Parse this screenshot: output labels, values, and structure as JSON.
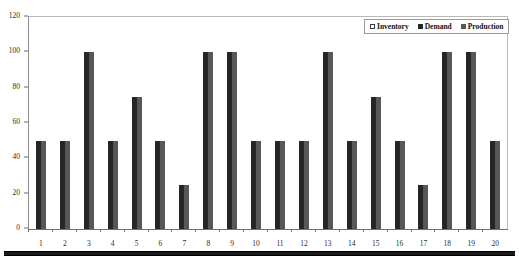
{
  "chart_data": {
    "type": "bar",
    "title": "",
    "xlabel": "",
    "ylabel": "",
    "ylim": [
      0,
      120
    ],
    "yticks": [
      0,
      20,
      40,
      60,
      80,
      100,
      120
    ],
    "grid": false,
    "legend_position": "top-right",
    "categories": [
      "1",
      "2",
      "3",
      "4",
      "5",
      "6",
      "7",
      "8",
      "9",
      "10",
      "11",
      "12",
      "13",
      "14",
      "15",
      "16",
      "17",
      "18",
      "19",
      "20"
    ],
    "series": [
      {
        "name": "Inventory",
        "color": "#ffffff",
        "values": [
          0,
          0,
          0,
          0,
          0,
          0,
          0,
          0,
          0,
          0,
          0,
          0,
          0,
          0,
          0,
          0,
          0,
          0,
          0,
          0
        ]
      },
      {
        "name": "Demand",
        "color": "#262626",
        "values": [
          50,
          50,
          100,
          50,
          75,
          50,
          25,
          100,
          100,
          50,
          50,
          50,
          100,
          50,
          75,
          50,
          25,
          100,
          100,
          50
        ]
      },
      {
        "name": "Production",
        "color": "#575757",
        "values": [
          50,
          50,
          100,
          50,
          75,
          50,
          25,
          100,
          100,
          50,
          50,
          50,
          100,
          50,
          75,
          50,
          25,
          100,
          100,
          50
        ]
      }
    ]
  },
  "legend": {
    "items": [
      {
        "label": "Inventory",
        "swatch": "legend-swatch-inventory"
      },
      {
        "label": "Demand",
        "swatch": "legend-swatch-demand"
      },
      {
        "label": "Production",
        "swatch": "legend-swatch-production"
      }
    ]
  }
}
